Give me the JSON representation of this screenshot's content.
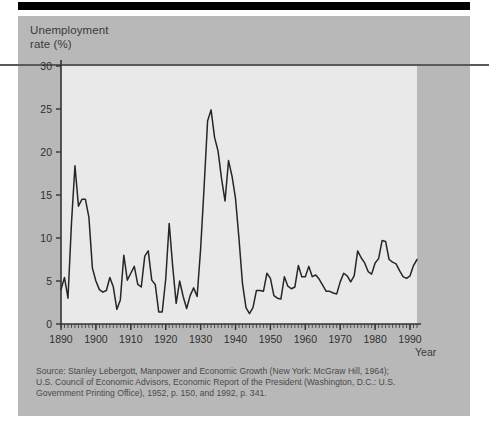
{
  "figure": {
    "y_axis_title_line1": "Unemployment",
    "y_axis_title_line2": "rate (%)",
    "x_axis_title": "Year",
    "source_label": "Source:",
    "source_line1": "Source: Stanley Lebergott, Manpower and Economic Growth (New York: McGraw Hill, 1964);",
    "source_line2": "U.S. Council of Economic Advisors, Economic Report of the President (Washington, D.C.: U.S.",
    "source_line3": "Government Printing Office), 1952, p. 150, and 1992, p. 341.",
    "colors": {
      "panel_background": "#b8b8b8",
      "plot_background": "#e9e9e9",
      "line": "#262626",
      "axis": "#333333",
      "top_bar": "#000000",
      "rule": "#5a5a5a",
      "text": "#3a3a3a",
      "source_text": "#4a4a4a"
    }
  },
  "chart_data": {
    "type": "line",
    "title": "",
    "xlabel": "Year",
    "ylabel": "Unemployment rate (%)",
    "xlim": [
      1890,
      1992
    ],
    "ylim": [
      0,
      30
    ],
    "y_ticks": [
      0,
      5,
      10,
      15,
      20,
      25,
      30
    ],
    "x_ticks": [
      1890,
      1900,
      1910,
      1920,
      1930,
      1940,
      1950,
      1960,
      1970,
      1980,
      1990
    ],
    "x_minor_tick_interval": 1,
    "grid": false,
    "legend": null,
    "series": [
      {
        "name": "Unemployment rate (%)",
        "x": [
          1890,
          1891,
          1892,
          1893,
          1894,
          1895,
          1896,
          1897,
          1898,
          1899,
          1900,
          1901,
          1902,
          1903,
          1904,
          1905,
          1906,
          1907,
          1908,
          1909,
          1910,
          1911,
          1912,
          1913,
          1914,
          1915,
          1916,
          1917,
          1918,
          1919,
          1920,
          1921,
          1922,
          1923,
          1924,
          1925,
          1926,
          1927,
          1928,
          1929,
          1930,
          1931,
          1932,
          1933,
          1934,
          1935,
          1936,
          1937,
          1938,
          1939,
          1940,
          1941,
          1942,
          1943,
          1944,
          1945,
          1946,
          1947,
          1948,
          1949,
          1950,
          1951,
          1952,
          1953,
          1954,
          1955,
          1956,
          1957,
          1958,
          1959,
          1960,
          1961,
          1962,
          1963,
          1964,
          1965,
          1966,
          1967,
          1968,
          1969,
          1970,
          1971,
          1972,
          1973,
          1974,
          1975,
          1976,
          1977,
          1978,
          1979,
          1980,
          1981,
          1982,
          1983,
          1984,
          1985,
          1986,
          1987,
          1988,
          1989,
          1990,
          1991,
          1992
        ],
        "values": [
          4.0,
          5.4,
          3.0,
          11.7,
          18.4,
          13.7,
          14.5,
          14.5,
          12.4,
          6.5,
          5.0,
          4.0,
          3.7,
          3.9,
          5.4,
          4.3,
          1.7,
          2.8,
          8.0,
          5.1,
          5.9,
          6.7,
          4.6,
          4.3,
          7.9,
          8.5,
          5.1,
          4.6,
          1.4,
          1.4,
          5.2,
          11.7,
          6.7,
          2.4,
          5.0,
          3.2,
          1.8,
          3.3,
          4.2,
          3.2,
          8.7,
          15.9,
          23.6,
          24.9,
          21.7,
          20.1,
          16.9,
          14.3,
          19.0,
          17.2,
          14.6,
          9.9,
          4.7,
          1.9,
          1.2,
          1.9,
          3.9,
          3.9,
          3.8,
          5.9,
          5.3,
          3.3,
          3.0,
          2.9,
          5.5,
          4.4,
          4.1,
          4.3,
          6.8,
          5.5,
          5.5,
          6.7,
          5.5,
          5.7,
          5.2,
          4.5,
          3.8,
          3.8,
          3.6,
          3.5,
          4.9,
          5.9,
          5.6,
          4.9,
          5.6,
          8.5,
          7.7,
          7.1,
          6.1,
          5.8,
          7.1,
          7.6,
          9.7,
          9.6,
          7.5,
          7.2,
          7.0,
          6.2,
          5.5,
          5.3,
          5.6,
          6.8,
          7.5
        ]
      }
    ],
    "annotations": [
      {
        "label": "peak 1894",
        "x": 1894,
        "y": 18.4
      },
      {
        "label": "peak 1933",
        "x": 1933,
        "y": 24.9
      },
      {
        "label": "trough 1944",
        "x": 1944,
        "y": 1.2
      },
      {
        "label": "peak 1982",
        "x": 1982,
        "y": 9.7
      }
    ]
  }
}
